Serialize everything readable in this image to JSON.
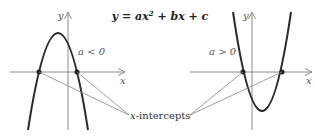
{
  "left_graph": {
    "condition": "a < 0",
    "y_axis_label": "y",
    "x_axis_label": "x",
    "opens": "down"
  },
  "right_graph": {
    "condition": "a > 0",
    "y_axis_label": "y",
    "x_axis_label": "x",
    "opens": "up"
  },
  "callout": {
    "label_prefix": "x",
    "label_suffix": "-intercepts"
  },
  "colors": {
    "curve": "#2a2a2a",
    "axis": "#8a8a8a",
    "leader": "#888888",
    "point": "#222222"
  }
}
